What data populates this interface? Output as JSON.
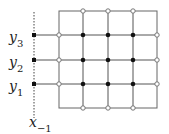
{
  "labels": {
    "y3": {
      "base": "y",
      "sub": "3"
    },
    "y2": {
      "base": "y",
      "sub": "2"
    },
    "y1": {
      "base": "y",
      "sub": "1"
    },
    "x": {
      "base": "x",
      "sub": "−1"
    }
  },
  "grid": {
    "columns": 5,
    "rows": 5,
    "line_color": "#555555",
    "filled_node_color": "#111111",
    "open_node_color": "#777777"
  }
}
